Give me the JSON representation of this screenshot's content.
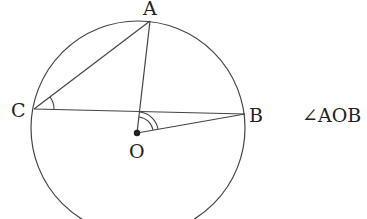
{
  "diagram": {
    "type": "geometry-circle",
    "circle": {
      "center_label": "O",
      "cx": 138,
      "cy": 128,
      "r": 107
    },
    "points": {
      "A": {
        "label": "A",
        "x": 150,
        "y": 21
      },
      "B": {
        "label": "B",
        "x": 245,
        "y": 114
      },
      "C": {
        "label": "C",
        "x": 34,
        "y": 109
      },
      "O": {
        "label": "O",
        "x": 137,
        "y": 133
      }
    },
    "segments": [
      "CA",
      "AO",
      "CB",
      "OB"
    ],
    "angle_marks": [
      {
        "vertex": "C",
        "between": [
          "A",
          "B"
        ],
        "arcs": 1
      },
      {
        "vertex": "O",
        "between": [
          "A",
          "B"
        ],
        "arcs": 2
      }
    ],
    "caption": "∠AOB"
  },
  "colors": {
    "stroke": "#444444",
    "text": "#222222",
    "background": "#ffffff"
  }
}
